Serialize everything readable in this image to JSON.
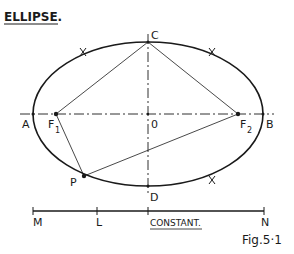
{
  "title": "ELLIPSE.",
  "figure_caption": "Fig.5·1",
  "colors": {
    "ink": "#1a1a1a",
    "background": "#ffffff"
  },
  "points": {
    "A": "A",
    "B": "B",
    "C": "C",
    "D": "D",
    "O": "0",
    "F1": {
      "main": "F",
      "sub": "1"
    },
    "F2": {
      "main": "F",
      "sub": "2"
    },
    "P": "P"
  },
  "constant_line": {
    "start_label": "M",
    "mid_label": "L",
    "end_label": "N",
    "caption": "CONSTANT."
  },
  "construction_marks": [
    "cross-upper-left",
    "cross-upper-right",
    "cross-lower-right"
  ]
}
